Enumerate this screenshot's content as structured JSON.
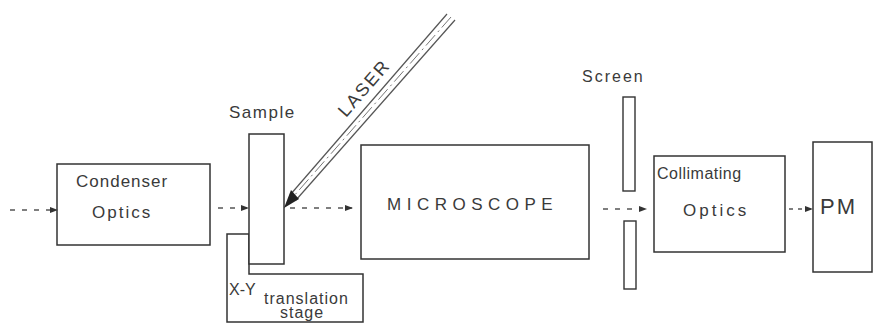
{
  "diagram": {
    "type": "optical-setup-block-diagram",
    "stroke_color": "#333333",
    "background": "#ffffff",
    "components": {
      "condenser": {
        "line1": "Condenser",
        "line2": "Optics"
      },
      "sample": {
        "label": "Sample"
      },
      "stage": {
        "line1": "X-Y",
        "line2": "translation",
        "line3": "stage"
      },
      "laser": {
        "label": "LASER"
      },
      "microscope": {
        "label": "MICROSCOPE"
      },
      "screen": {
        "label": "Screen"
      },
      "collimating": {
        "line1": "Collimating",
        "line2": "Optics"
      },
      "detector": {
        "label": "PM"
      }
    },
    "beam_path": [
      "input",
      "Condenser Optics",
      "Sample",
      "MICROSCOPE",
      "Screen aperture",
      "Collimating Optics",
      "PM"
    ]
  }
}
